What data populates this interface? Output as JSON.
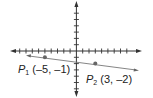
{
  "diagram": {
    "type": "coordinate-plane-line",
    "colors": {
      "axis": "#333333",
      "line": "#777777",
      "point": "#666666",
      "text": "#222222"
    },
    "points": [
      {
        "name": "P",
        "sub": "1",
        "coords": "(–5, –1)",
        "x": -5,
        "y": -1
      },
      {
        "name": "P",
        "sub": "2",
        "coords": "(3, –2)",
        "x": 3,
        "y": -2
      }
    ]
  }
}
